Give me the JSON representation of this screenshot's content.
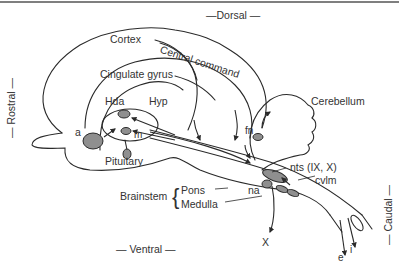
{
  "orientation": {
    "dorsal": "—Dorsal —",
    "ventral": "—   Ventral   —",
    "rostral": "—  Rostral  —",
    "caudal": "—  Caudal  —"
  },
  "labels": {
    "cortex": "Cortex",
    "central_command": "Central command",
    "cingulate_gyrus": "Cingulate gyrus",
    "hda": "Hda",
    "hyp": "Hyp",
    "a": "a",
    "m": "m",
    "pituitary": "Pituitary",
    "cerebellum": "Cerebellum",
    "fn": "fn",
    "nts": "nts (IX, X)",
    "cvlm": "cvlm",
    "na": "na",
    "brainstem": "Brainstem",
    "pons": "Pons",
    "medulla": "Medulla",
    "x": "X",
    "e": "e",
    "i": "i"
  },
  "colors": {
    "line": "#2a2a2a",
    "nucleus_fill": "#8f8f8f",
    "top_rule": "#555555"
  }
}
